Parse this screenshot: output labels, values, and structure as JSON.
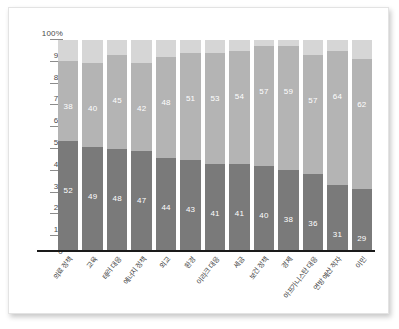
{
  "chart_data": {
    "type": "bar",
    "subtype": "100% stacked bar",
    "title": "",
    "subtitle": "",
    "xlabel": "",
    "ylabel": "",
    "ylim": [
      0,
      100
    ],
    "grid": false,
    "legend_position": "none",
    "y_ticks": [
      "100%",
      "90",
      "80",
      "70",
      "60",
      "50",
      "40",
      "30",
      "20",
      "10",
      "0"
    ],
    "y_tick_values": [
      100,
      90,
      80,
      70,
      60,
      50,
      40,
      30,
      20,
      10,
      0
    ],
    "categories": [
      "의료 정책",
      "교육",
      "테러 대응",
      "에너지 정책",
      "외교",
      "환경",
      "이라크 대응",
      "세금",
      "보건 정책",
      "경제",
      "아프가니스탄 대응",
      "연방 예산 적자",
      "이민"
    ],
    "series": [
      {
        "name": "bottom-segment",
        "color": "#7a7a7a",
        "values": [
          52,
          49,
          48,
          47,
          44,
          43,
          41,
          41,
          40,
          38,
          36,
          31,
          29
        ]
      },
      {
        "name": "middle-segment",
        "color": "#b4b4b4",
        "values": [
          38,
          40,
          45,
          42,
          48,
          51,
          53,
          54,
          57,
          59,
          57,
          64,
          62
        ]
      },
      {
        "name": "top-segment",
        "color": "#d6d6d6",
        "values": [
          10,
          11,
          7,
          11,
          8,
          6,
          6,
          5,
          3,
          3,
          7,
          5,
          9
        ]
      }
    ]
  },
  "colors": {
    "segment_bottom": "#7a7a7a",
    "segment_middle": "#b4b4b4",
    "segment_top": "#d6d6d6",
    "axis": "#1a1a1a",
    "tick_text": "#4a4a4a",
    "label_text": "#3c3c3c",
    "frame_border": "#e3e3e3",
    "background": "#ffffff"
  }
}
